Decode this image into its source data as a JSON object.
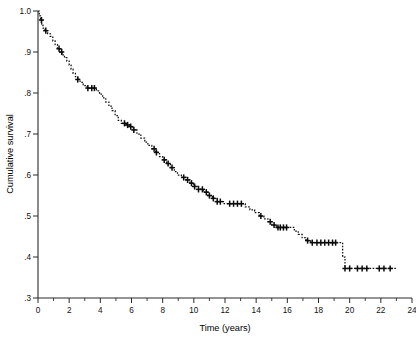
{
  "chart_data": {
    "type": "line",
    "title": "",
    "subtitle": "",
    "xlabel": "Time (years)",
    "ylabel": "Cumulative survival",
    "xlim": [
      0,
      24
    ],
    "ylim": [
      0.3,
      1.0
    ],
    "grid": false,
    "legend": null,
    "plot_style": "kaplan-meier step function, dashed line with censoring tick marks",
    "x_ticks_major": [
      0,
      2,
      4,
      6,
      8,
      10,
      12,
      14,
      16,
      18,
      20,
      22,
      24
    ],
    "x_tick_labels": [
      "0",
      "2",
      "4",
      "6",
      "8",
      "10",
      "12",
      "14",
      "16",
      "18",
      "20",
      "22",
      "24"
    ],
    "x_ticks_minor": [
      1,
      3,
      5,
      7,
      9,
      11,
      13,
      15,
      17,
      19,
      21,
      23
    ],
    "y_ticks_major": [
      1.0,
      0.9,
      0.8,
      0.7,
      0.6,
      0.5,
      0.4,
      0.3
    ],
    "y_tick_labels": [
      "1.0",
      ".9",
      ".8",
      ".7",
      ".6",
      ".5",
      ".4",
      ".3"
    ],
    "series": [
      {
        "name": "Cumulative survival",
        "step_points": [
          [
            0.0,
            1.0
          ],
          [
            0.08,
            0.988
          ],
          [
            0.16,
            0.978
          ],
          [
            0.24,
            0.968
          ],
          [
            0.32,
            0.958
          ],
          [
            0.45,
            0.952
          ],
          [
            0.62,
            0.945
          ],
          [
            0.78,
            0.938
          ],
          [
            0.95,
            0.927
          ],
          [
            1.1,
            0.918
          ],
          [
            1.25,
            0.908
          ],
          [
            1.4,
            0.9
          ],
          [
            1.55,
            0.893
          ],
          [
            1.7,
            0.886
          ],
          [
            1.85,
            0.878
          ],
          [
            2.0,
            0.868
          ],
          [
            2.12,
            0.858
          ],
          [
            2.25,
            0.848
          ],
          [
            2.4,
            0.84
          ],
          [
            2.55,
            0.833
          ],
          [
            2.7,
            0.826
          ],
          [
            2.9,
            0.818
          ],
          [
            3.15,
            0.812
          ],
          [
            3.6,
            0.812
          ],
          [
            3.75,
            0.805
          ],
          [
            3.95,
            0.797
          ],
          [
            4.15,
            0.788
          ],
          [
            4.35,
            0.778
          ],
          [
            4.55,
            0.768
          ],
          [
            4.75,
            0.757
          ],
          [
            4.95,
            0.745
          ],
          [
            5.15,
            0.733
          ],
          [
            5.35,
            0.726
          ],
          [
            5.6,
            0.722
          ],
          [
            5.9,
            0.718
          ],
          [
            6.1,
            0.71
          ],
          [
            6.35,
            0.7
          ],
          [
            6.6,
            0.69
          ],
          [
            6.85,
            0.68
          ],
          [
            7.05,
            0.672
          ],
          [
            7.3,
            0.664
          ],
          [
            7.55,
            0.655
          ],
          [
            7.8,
            0.645
          ],
          [
            8.0,
            0.637
          ],
          [
            8.25,
            0.628
          ],
          [
            8.5,
            0.618
          ],
          [
            8.75,
            0.608
          ],
          [
            8.95,
            0.6
          ],
          [
            9.2,
            0.594
          ],
          [
            9.5,
            0.588
          ],
          [
            9.75,
            0.58
          ],
          [
            10.0,
            0.572
          ],
          [
            10.3,
            0.565
          ],
          [
            10.6,
            0.558
          ],
          [
            10.9,
            0.55
          ],
          [
            11.2,
            0.543
          ],
          [
            11.5,
            0.535
          ],
          [
            11.9,
            0.53
          ],
          [
            13.0,
            0.53
          ],
          [
            13.3,
            0.522
          ],
          [
            13.6,
            0.515
          ],
          [
            13.9,
            0.508
          ],
          [
            14.2,
            0.5
          ],
          [
            14.5,
            0.493
          ],
          [
            14.75,
            0.486
          ],
          [
            15.0,
            0.478
          ],
          [
            15.3,
            0.472
          ],
          [
            16.2,
            0.472
          ],
          [
            16.45,
            0.463
          ],
          [
            16.7,
            0.455
          ],
          [
            16.95,
            0.447
          ],
          [
            17.2,
            0.44
          ],
          [
            17.5,
            0.435
          ],
          [
            19.4,
            0.435
          ],
          [
            19.55,
            0.4
          ],
          [
            19.7,
            0.372
          ],
          [
            23.0,
            0.372
          ]
        ],
        "censoring_times": [
          0.22,
          0.5,
          1.35,
          1.52,
          2.55,
          3.2,
          3.45,
          3.62,
          5.55,
          5.75,
          5.95,
          6.15,
          7.45,
          7.6,
          8.1,
          8.35,
          8.6,
          9.35,
          9.6,
          9.85,
          10.05,
          10.3,
          10.55,
          10.8,
          11.0,
          11.25,
          11.5,
          11.7,
          12.3,
          12.55,
          12.8,
          13.05,
          14.3,
          14.9,
          15.15,
          15.4,
          15.55,
          15.75,
          15.95,
          17.3,
          17.6,
          17.9,
          18.15,
          18.4,
          18.65,
          18.9,
          19.1,
          19.7,
          20.0,
          20.5,
          20.8,
          21.1,
          21.9,
          22.2,
          22.6
        ]
      }
    ]
  },
  "axes": {
    "x_title": "Time (years)",
    "y_title": "Cumulative survival"
  }
}
